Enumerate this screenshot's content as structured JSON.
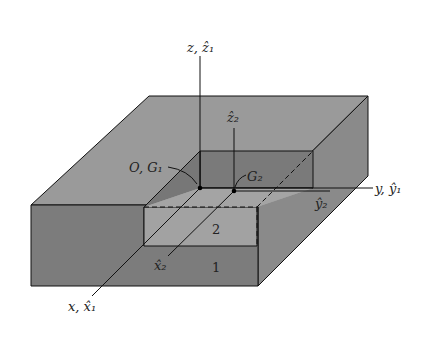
{
  "diagram": {
    "colors": {
      "background": "#ffffff",
      "top_face": "#9a9a9a",
      "front_face": "#7c7c7c",
      "side_face": "#8a8a8a",
      "cavity_wall": "#7a7a7a",
      "cavity_floor": "#a2a2a2",
      "line": "#111111"
    },
    "labels": {
      "z_axis": "z, ẑ₁",
      "z2_axis": "ẑ₂",
      "y_axis": "y, ŷ₁",
      "y2_axis": "ŷ₂",
      "x_axis": "x, x̂₁",
      "x2_axis": "x̂₂",
      "origin": "O, G₁",
      "g2": "G₂",
      "body1": "1",
      "body2": "2"
    }
  }
}
